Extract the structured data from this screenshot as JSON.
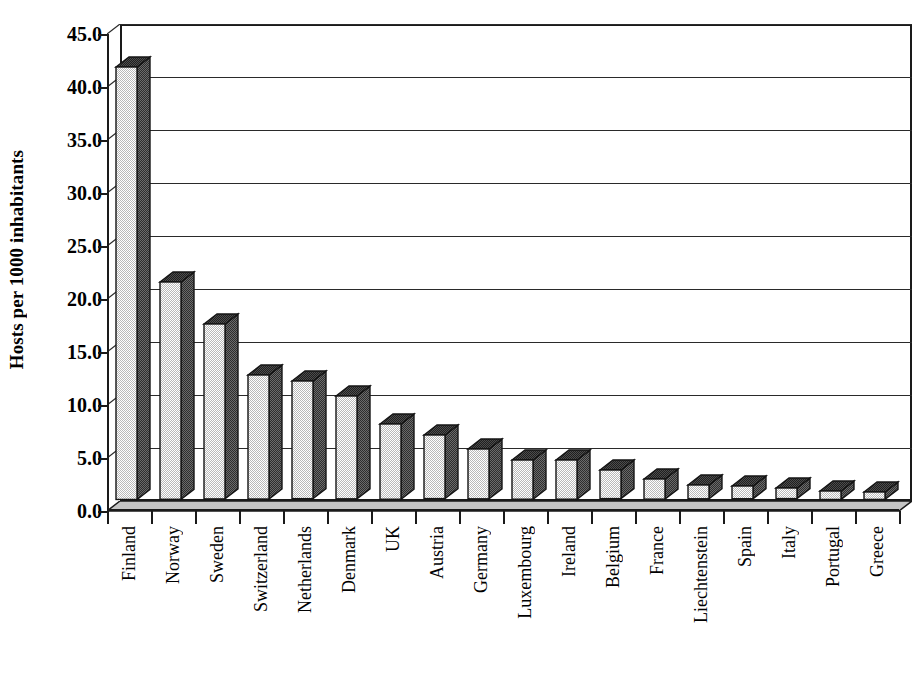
{
  "chart_data": {
    "type": "bar",
    "title": "",
    "xlabel": "",
    "ylabel": "Hosts per 1000 inhabitants",
    "ylim": [
      0,
      45
    ],
    "ytick_step": 5,
    "grid": true,
    "legend": "none",
    "style": "3d-column",
    "categories": [
      "Finland",
      "Norway",
      "Sweden",
      "Switzerland",
      "Netherlands",
      "Denmark",
      "UK",
      "Austria",
      "Germany",
      "Luxembourg",
      "Ireland",
      "Belgium",
      "France",
      "Liechtenstein",
      "Spain",
      "Italy",
      "Portugal",
      "Greece"
    ],
    "values": [
      40.8,
      20.5,
      16.5,
      11.7,
      11.1,
      9.7,
      7.1,
      6.0,
      4.7,
      3.7,
      3.7,
      2.7,
      1.9,
      1.3,
      1.2,
      1.0,
      0.8,
      0.7
    ],
    "ytick_labels": [
      "0.0",
      "5.0",
      "10.0",
      "15.0",
      "20.0",
      "25.0",
      "30.0",
      "35.0",
      "40.0",
      "45.0"
    ],
    "ytick_values": [
      0,
      5,
      10,
      15,
      20,
      25,
      30,
      35,
      40,
      45
    ]
  },
  "colors": {
    "bar_front": "#b9b9b9",
    "bar_side": "#6b6b6b",
    "bar_top": "#4d4d4d",
    "axis": "#1a1a1a",
    "grid": "#2a2a2a",
    "plot_background": "#ffffff",
    "floor": "#c4c4c4",
    "text": "#000000"
  }
}
